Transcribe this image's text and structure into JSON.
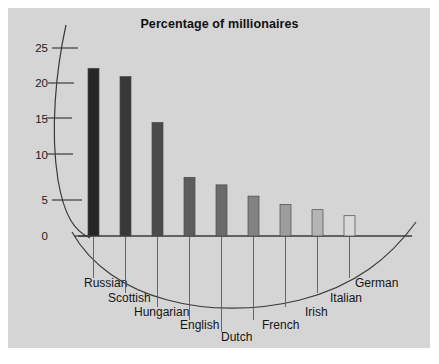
{
  "panel": {
    "background_color": "#d5d5d5",
    "outer_background_color": "#ffffff"
  },
  "title": "Percentage of millionaires",
  "chart_data": {
    "type": "bar",
    "title": "Percentage of millionaires",
    "subtitle": "",
    "xlabel": "",
    "ylabel": "",
    "categories": [
      "Russian",
      "Scottish",
      "Hungarian",
      "English",
      "Dutch",
      "French",
      "Irish",
      "Italian",
      "German"
    ],
    "values": [
      22.3,
      21.2,
      15.1,
      7.8,
      6.8,
      5.3,
      4.2,
      3.5,
      2.7
    ],
    "series": [
      {
        "name": "Percentage of millionaires",
        "values": [
          22.3,
          21.2,
          15.1,
          7.8,
          6.8,
          5.3,
          4.2,
          3.5,
          2.7
        ]
      }
    ],
    "ylim": [
      0,
      27
    ],
    "yticks": [
      0,
      5,
      10,
      15,
      20,
      25
    ],
    "ytick_labels": [
      "0",
      "5",
      "10",
      "15",
      "20",
      "25"
    ],
    "grid": false,
    "legend": false,
    "legend_position": "none",
    "bar_colors": [
      "#262626",
      "#383838",
      "#4a4a4a",
      "#5c5c5c",
      "#6b6b6b",
      "#838383",
      "#9d9d9d",
      "#b4b4b4",
      "#d9d9d9"
    ],
    "bar_edge_color": "#4a4a4a",
    "axis_color": "#3a3a3a",
    "annotations": [
      "Curved decorative axis arc on the left replacing a straight y-axis",
      "Second decorative arc sweeps beneath the baseline through the staggered category labels",
      "Leader lines drop from each bar down to its category label"
    ]
  },
  "axis": {
    "tick_labels": [
      "25",
      "20",
      "15",
      "10",
      "5",
      "0"
    ]
  },
  "categories_display": [
    {
      "label": "Russian"
    },
    {
      "label": "Scottish"
    },
    {
      "label": "Hungarian"
    },
    {
      "label": "English"
    },
    {
      "label": "Dutch"
    },
    {
      "label": "French"
    },
    {
      "label": "Irish"
    },
    {
      "label": "Italian"
    },
    {
      "label": "German"
    }
  ]
}
